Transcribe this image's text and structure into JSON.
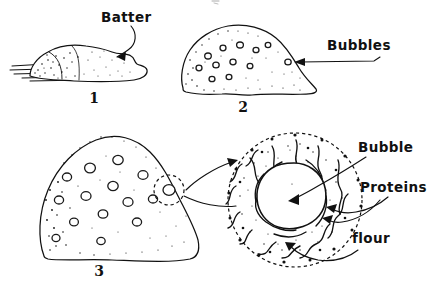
{
  "figure": {
    "background_color": "#ffffff",
    "ink_color": "#111111",
    "style": "hand-drawn pen-and-ink sketch"
  },
  "panels": [
    {
      "number": "1",
      "name": "flat-batter",
      "description": "Low flat mound of unrisen batter resting on a surface",
      "bubble_count": 0,
      "stipple": "heavy on left, light on right"
    },
    {
      "number": "2",
      "name": "rising-batter",
      "description": "Taller domed mound with many small bubbles forming",
      "bubble_count": 12,
      "stipple": "heavy along left and bottom edges"
    },
    {
      "number": "3",
      "name": "risen-batter",
      "description": "Tall domed mound with enlarged bubbles, one circled for magnification",
      "bubble_count": 14,
      "stipple": "heavy along left edge and base"
    }
  ],
  "detail": {
    "name": "magnified-bubble-cross-section",
    "description": "Close-up of a single gas bubble surrounded by protein network and flour particles",
    "center_label": "bubble void",
    "boundary_style": "dashed"
  },
  "labels": {
    "batter": "Batter",
    "bubbles": "Bubbles",
    "bubble": "Bubble",
    "proteins": "Proteins",
    "flour": "flour"
  },
  "numbers": {
    "one": "1",
    "two": "2",
    "three": "3"
  }
}
